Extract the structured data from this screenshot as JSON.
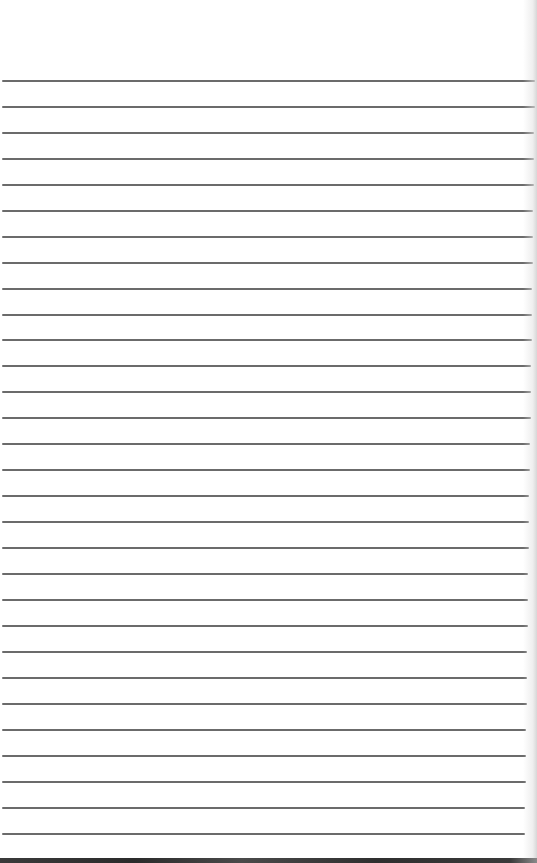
{
  "page": {
    "type": "lined-paper",
    "width": 537,
    "height": 863,
    "background_color": "#ffffff",
    "rule_color": "#6b6b6b",
    "bottom_edge_color": "#333333"
  },
  "rules": {
    "count": 30,
    "first_y": 80,
    "spacing": 25.9,
    "positions": [
      80,
      106,
      132,
      158,
      184,
      210,
      236,
      262,
      288,
      314,
      339,
      365,
      391,
      417,
      443,
      469,
      495,
      521,
      547,
      573,
      599,
      625,
      651,
      677,
      703,
      729,
      755,
      781,
      807,
      833
    ]
  }
}
